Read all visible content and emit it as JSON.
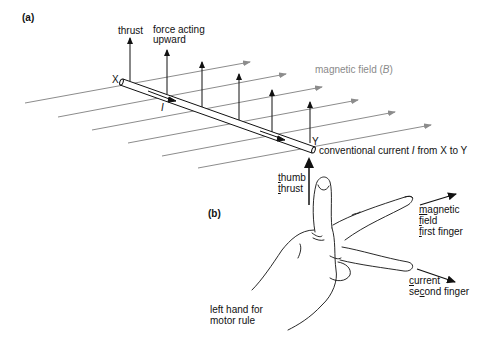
{
  "figure": {
    "panel_a": {
      "label": "(a)",
      "labels": {
        "thrust": "thrust",
        "force_line1": "force acting",
        "force_line2": "upward",
        "end_x": "X",
        "end_y": "Y",
        "current_symbol": "I",
        "field_prefix": "magnetic field (",
        "field_symbol": "B",
        "field_suffix": ")",
        "current_prefix": "conventional current ",
        "current_italic": "I",
        "current_suffix": " from X to Y"
      },
      "colors": {
        "field_lines": "#8c8c8c",
        "ink": "#111111"
      },
      "field_line_count": 6,
      "force_arrow_count": 6
    },
    "panel_b": {
      "label": "(b)",
      "thumb": {
        "line1_first": "t",
        "line1_rest": "humb",
        "line2_first": "t",
        "line2_rest": "hrust"
      },
      "first_finger": {
        "line1_first": "m",
        "line1_rest": "agnetic",
        "line2_first": "f",
        "line2_rest": "ield",
        "line3_first": "f",
        "line3_rest": "irst finger"
      },
      "second_finger": {
        "line1_first": "c",
        "line1_rest": "urrent",
        "line2_a": "se",
        "line2_u": "c",
        "line2_b": "ond finger"
      },
      "caption_line1": "left hand for",
      "caption_line2": "motor rule"
    }
  }
}
